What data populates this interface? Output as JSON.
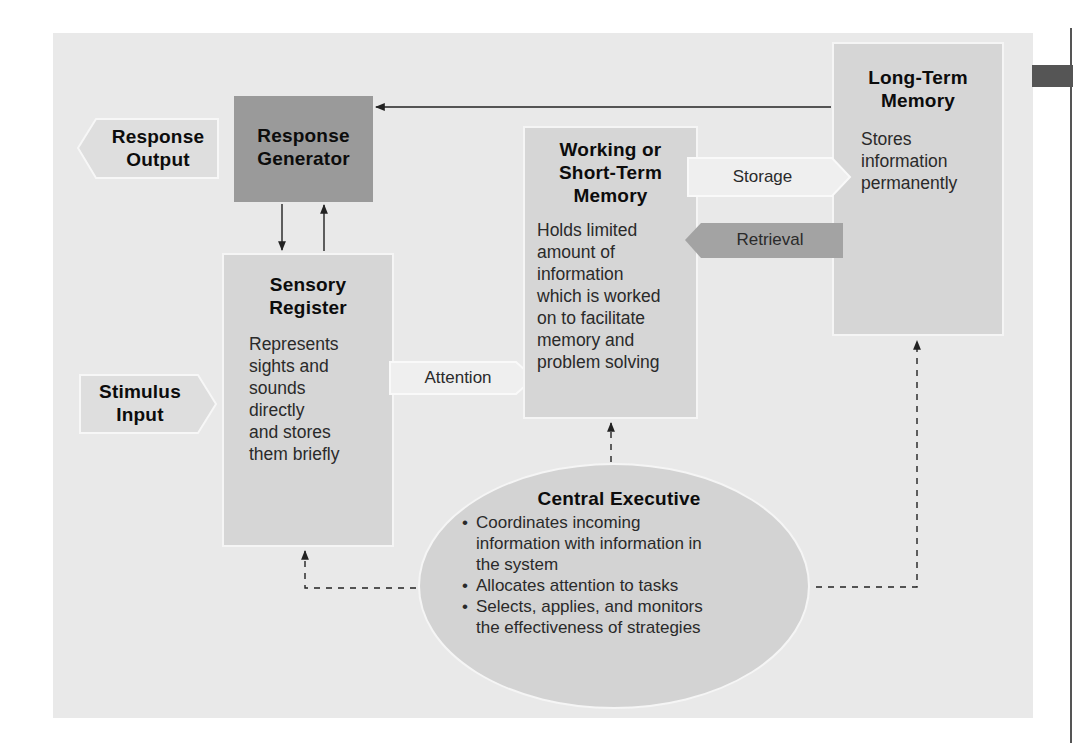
{
  "diagram": {
    "colors": {
      "panel_bg": "#e9e9e9",
      "box_bg": "#d6d6d6",
      "dark_box_bg": "#9a9a9a",
      "arrow_light_bg": "#efefef",
      "arrow_dark_bg": "#a3a3a3",
      "ellipse_bg": "#d3d3d3",
      "line": "#222222"
    },
    "nodes": {
      "response_output": {
        "label_line1": "Response",
        "label_line2": "Output"
      },
      "response_generator": {
        "label_line1": "Response",
        "label_line2": "Generator"
      },
      "stimulus_input": {
        "label_line1": "Stimulus",
        "label_line2": "Input"
      },
      "sensory_register": {
        "title_line1": "Sensory",
        "title_line2": "Register",
        "description_lines": [
          "Represents",
          "sights and",
          "sounds",
          "directly",
          "and stores",
          "them briefly"
        ]
      },
      "working_memory": {
        "title_line1": "Working or",
        "title_line2": "Short-Term",
        "title_line3": "Memory",
        "description_lines": [
          "Holds limited",
          "amount of",
          "information",
          "which is worked",
          "on to facilitate",
          "memory and",
          "problem solving"
        ]
      },
      "long_term_memory": {
        "title_line1": "Long-Term",
        "title_line2": "Memory",
        "description_lines": [
          "Stores",
          "information",
          "permanently"
        ]
      },
      "central_executive": {
        "title": "Central Executive",
        "bullets": [
          {
            "line1": "Coordinates incoming",
            "line2": "information with information in",
            "line3": "the system"
          },
          {
            "line1": "Allocates attention to tasks"
          },
          {
            "line1": "Selects, applies, and monitors",
            "line2": "the effectiveness of strategies"
          }
        ]
      }
    },
    "edges": {
      "attention": "Attention",
      "storage": "Storage",
      "retrieval": "Retrieval"
    }
  }
}
